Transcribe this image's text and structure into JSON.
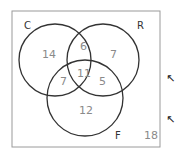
{
  "diagram": {
    "type": "venn-3",
    "sets": [
      {
        "id": "C",
        "label": "C"
      },
      {
        "id": "R",
        "label": "R"
      },
      {
        "id": "F",
        "label": "F"
      }
    ],
    "regions": {
      "C_only": "14",
      "R_only": "7",
      "F_only": "12",
      "C_and_R_only": "6",
      "C_and_F_only": "7",
      "R_and_F_only": "5",
      "C_and_R_and_F": "11",
      "outside": "18"
    },
    "colors": {
      "outline": "#333333",
      "border": "#9a9a9a",
      "number_text": "#8a8a8a",
      "arrow": "#222222"
    },
    "arrows": [
      {
        "icon": "arrow-up-left-icon",
        "glyph": "↖"
      },
      {
        "icon": "arrow-up-left-icon",
        "glyph": "↖"
      }
    ]
  }
}
